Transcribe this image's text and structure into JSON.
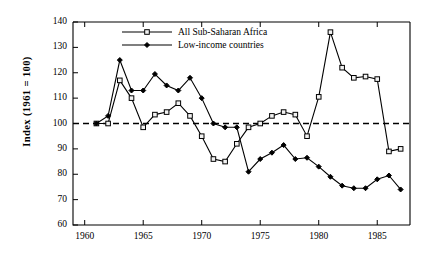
{
  "chart_data": {
    "type": "line",
    "title": "",
    "subtitle": "",
    "xlabel": "",
    "ylabel": "Index  (1961  =  100)",
    "xlim": [
      1959,
      1987.8
    ],
    "ylim": [
      60,
      140
    ],
    "ytick_labels": [
      "60",
      "70",
      "80",
      "90",
      "100",
      "110",
      "120",
      "130",
      "140"
    ],
    "ytick_values": [
      60,
      70,
      80,
      90,
      100,
      110,
      120,
      130,
      140
    ],
    "xtick_labels": [
      "1960",
      "1965",
      "1970",
      "1975",
      "1980",
      "1985"
    ],
    "xtick_values": [
      1960,
      1965,
      1970,
      1975,
      1980,
      1985
    ],
    "grid": false,
    "legend_position": "top-left-inside",
    "reference_line": {
      "y": 100,
      "style": "dashed",
      "label": ""
    },
    "x": [
      1961,
      1962,
      1963,
      1964,
      1965,
      1966,
      1967,
      1968,
      1969,
      1970,
      1971,
      1972,
      1973,
      1974,
      1975,
      1976,
      1977,
      1978,
      1979,
      1980,
      1981,
      1982,
      1983,
      1984,
      1985,
      1986,
      1987
    ],
    "series": [
      {
        "name": "All Sub-Saharan Africa",
        "marker": "open-square",
        "values": [
          100,
          100,
          117,
          110,
          98.5,
          103.5,
          104.5,
          108,
          103,
          95,
          86,
          85,
          92,
          98.5,
          100,
          103,
          104.5,
          103.5,
          95,
          110.5,
          136,
          122,
          118,
          118.5,
          117.5,
          89,
          90
        ]
      },
      {
        "name": "Low-income countries",
        "marker": "filled-diamond",
        "values": [
          100,
          103,
          125,
          113,
          113,
          119.5,
          115,
          113,
          118,
          110,
          100,
          98.5,
          98.5,
          81,
          86,
          88.5,
          91.5,
          86,
          86.5,
          83,
          79,
          75.5,
          74.5,
          74.5,
          78,
          79.5,
          74
        ]
      }
    ]
  },
  "axis": {
    "y_label_text": "Index  (1961  =  100)"
  }
}
